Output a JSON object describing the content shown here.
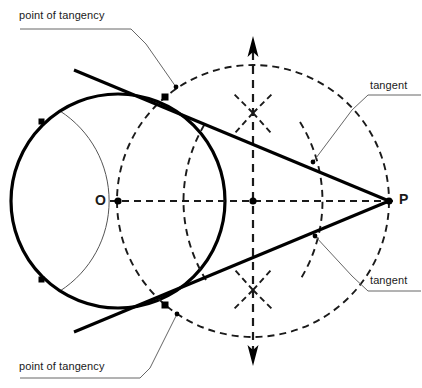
{
  "figure": {
    "width": 422,
    "height": 388,
    "background_color": "#ffffff",
    "stroke_color": "#000000",
    "construction_color": "#1a1a1a",
    "thin_arc_color": "#4d4d4d",
    "leader_color": "#666666"
  },
  "labels": {
    "point_of_tangency_top": "point of tangency",
    "point_of_tangency_bottom": "point of tangency",
    "tangent_top": "tangent",
    "tangent_bottom": "tangent",
    "center": "O",
    "external_point": "P"
  },
  "geometry": {
    "circle_main": {
      "cx": 118,
      "cy": 201,
      "r": 107,
      "style": "solid-bold"
    },
    "circle_thales": {
      "cx": 253,
      "cy": 201,
      "r": 136,
      "style": "dashed"
    },
    "center_point": {
      "x": 118,
      "y": 201
    },
    "external_point": {
      "x": 389,
      "y": 201
    },
    "midpoint_op": {
      "x": 253,
      "y": 201
    },
    "tangency_point_top": {
      "x": 165,
      "y": 97
    },
    "tangency_point_bottom": {
      "x": 165,
      "y": 305
    },
    "bisector_arc_intersection_top": {
      "x": 253,
      "y": 113
    },
    "bisector_arc_intersection_bottom": {
      "x": 253,
      "y": 290
    },
    "compass_mark_left_top": {
      "x": 42,
      "y": 122
    },
    "compass_mark_left_bottom": {
      "x": 42,
      "y": 280
    },
    "axis_op": {
      "x1": 118,
      "y1": 201,
      "x2": 389,
      "y2": 201,
      "style": "dashed"
    },
    "perpendicular_bisector": {
      "x1": 253,
      "y1": 42,
      "x2": 253,
      "y2": 360,
      "style": "dashed-double-arrow"
    }
  },
  "leaders": {
    "point_of_tangency_top": {
      "underline": [
        [
          20,
          29
        ],
        [
          131,
          29
        ]
      ],
      "bend": [
        [
          131,
          29
        ],
        [
          146,
          44
        ]
      ],
      "tip": [
        [
          146,
          44
        ],
        [
          176,
          87
        ]
      ]
    },
    "point_of_tangency_bottom": {
      "underline": [
        [
          20,
          378
        ],
        [
          140,
          378
        ]
      ],
      "bend": [
        [
          140,
          378
        ],
        [
          150,
          368
        ]
      ],
      "tip": [
        [
          150,
          368
        ],
        [
          177,
          314
        ]
      ]
    },
    "tangent_top": {
      "underline": [
        [
          368,
          95
        ],
        [
          420,
          95
        ]
      ],
      "bend": [
        [
          368,
          95
        ],
        [
          352,
          110
        ]
      ],
      "tip": [
        [
          352,
          110
        ],
        [
          313,
          162
        ]
      ]
    },
    "tangent_bottom": {
      "underline": [
        [
          368,
          291
        ],
        [
          420,
          291
        ]
      ],
      "bend": [
        [
          368,
          291
        ],
        [
          352,
          276
        ]
      ],
      "tip": [
        [
          352,
          276
        ],
        [
          315,
          236
        ]
      ]
    }
  }
}
